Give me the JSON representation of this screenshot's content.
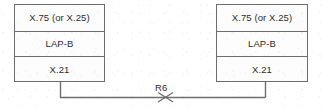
{
  "diagram": {
    "background_color": "#ffffff",
    "line_color": "#6d6d6d",
    "text_color": "#2c2c2c",
    "stacks": [
      {
        "id": "left-stack",
        "position": "left",
        "layers": [
          {
            "label": "X.75 (or X.25)"
          },
          {
            "label": "LAP-B"
          },
          {
            "label": "X.21"
          }
        ]
      },
      {
        "id": "right-stack",
        "position": "right",
        "layers": [
          {
            "label": "X.75 (or X.25)"
          },
          {
            "label": "LAP-B"
          },
          {
            "label": "X.21"
          }
        ]
      }
    ],
    "link": {
      "label": "R6",
      "marker": "cross-x-icon"
    }
  }
}
